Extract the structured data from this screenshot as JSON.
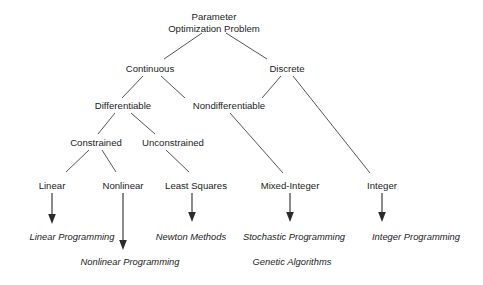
{
  "diagram": {
    "type": "tree",
    "colors": {
      "background": "#ffffff",
      "text": "#1d1d1d",
      "edge": "#555555",
      "arrow": "#2b2b2b"
    },
    "nodes": {
      "root_line1": "Parameter",
      "root_line2": "Optimization Problem",
      "continuous": "Continuous",
      "discrete": "Discrete",
      "differentiable": "Differentiable",
      "nondifferentiable": "Nondifferentiable",
      "constrained": "Constrained",
      "unconstrained": "Unconstrained",
      "linear": "Linear",
      "nonlinear": "Nonlinear",
      "least_squares": "Least Squares",
      "mixed_integer": "Mixed-Integer",
      "integer": "Integer"
    },
    "methods": {
      "linear_programming": "Linear Programming",
      "nonlinear_programming": "Nonlinear Programming",
      "newton_methods": "Newton Methods",
      "stochastic_programming": "Stochastic Programming",
      "genetic_algorithms": "Genetic Algorithms",
      "integer_programming": "Integer Programming"
    }
  }
}
